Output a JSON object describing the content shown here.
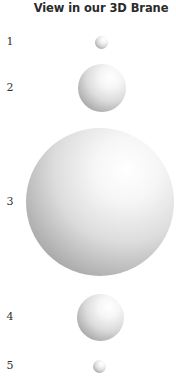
{
  "title": "View in our 3D Brane",
  "colors": {
    "background": "#ffffff",
    "title_text": "#2b2b2b",
    "label_text": "#333333",
    "sphere_highlight": "#ffffff",
    "sphere_shadow": "#8a8a8a"
  },
  "items": [
    {
      "label": "1",
      "cx": 101,
      "cy": 42,
      "diameter": 13
    },
    {
      "label": "2",
      "cx": 102,
      "cy": 88,
      "diameter": 48
    },
    {
      "label": "3",
      "cx": 100,
      "cy": 202,
      "diameter": 148
    },
    {
      "label": "4",
      "cx": 100,
      "cy": 317,
      "diameter": 47
    },
    {
      "label": "5",
      "cx": 99,
      "cy": 366,
      "diameter": 13
    }
  ]
}
